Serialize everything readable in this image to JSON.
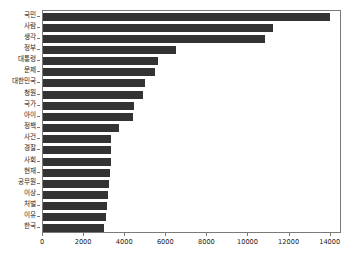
{
  "chart_data": {
    "type": "bar",
    "orientation": "horizontal",
    "title": "",
    "subtitle": "",
    "xlabel": "",
    "ylabel": "",
    "grid": false,
    "legend": false,
    "legend_position": "none",
    "bar_color": "#333333",
    "background_color": "#ffffff",
    "axis_color": "#7a7a7a",
    "xlim": [
      0,
      14550
    ],
    "xticks": [
      0,
      2000,
      4000,
      6000,
      8000,
      10000,
      12000,
      14000
    ],
    "xtick_labels": [
      "0",
      "2000",
      "4000",
      "6000",
      "8000",
      "10000",
      "12000",
      "14000"
    ],
    "categories": [
      "국민",
      "사람",
      "생각",
      "정부",
      "대통령",
      "문제",
      "대한민국",
      "청원",
      "국가",
      "아이",
      "정책",
      "사건",
      "경찰",
      "사회",
      "현재",
      "공무원",
      "이상",
      "처벌",
      "이유",
      "한국"
    ],
    "values": [
      13950,
      11200,
      10800,
      6450,
      5600,
      5450,
      4950,
      4850,
      4450,
      4400,
      3700,
      3300,
      3300,
      3300,
      3250,
      3200,
      3150,
      3100,
      3050,
      2950
    ]
  }
}
